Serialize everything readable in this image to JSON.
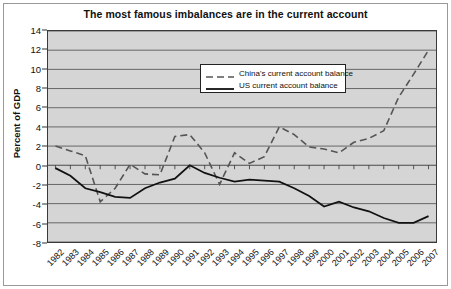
{
  "chart_data": {
    "type": "line",
    "title": "The most famous imbalances are in the current account",
    "xlabel": "",
    "ylabel": "Percent of GDP",
    "ylim": [
      -8,
      14
    ],
    "ytick_step": 2,
    "yticks": [
      "14",
      "12",
      "10",
      "8",
      "6",
      "4",
      "2",
      "0",
      "-2",
      "-4",
      "-6",
      "-8"
    ],
    "grid": true,
    "legend_position": "top-center",
    "plot_background": "#d5d5d5",
    "categories": [
      "1982",
      "1983",
      "1984",
      "1985",
      "1986",
      "1987",
      "1988",
      "1989",
      "1990",
      "1991",
      "1992",
      "1993",
      "1994",
      "1995",
      "1996",
      "1997",
      "1998",
      "1999",
      "2000",
      "2001",
      "2002",
      "2003",
      "2004",
      "2005",
      "2006",
      "2007"
    ],
    "series": [
      {
        "name": "China's current account balance",
        "style": "dashed",
        "color": "#555555",
        "values": [
          2.0,
          1.5,
          1.0,
          -3.8,
          -2.4,
          0.1,
          -0.9,
          -1.0,
          3.0,
          3.2,
          1.3,
          -2.0,
          1.3,
          0.2,
          0.9,
          4.0,
          3.2,
          1.9,
          1.7,
          1.3,
          2.4,
          2.8,
          3.6,
          7.1,
          9.5,
          12.0
        ]
      },
      {
        "name": "US current account balance",
        "style": "solid",
        "color": "#111111",
        "values": [
          -0.3,
          -1.1,
          -2.4,
          -2.8,
          -3.3,
          -3.4,
          -2.4,
          -1.8,
          -1.4,
          0.0,
          -0.8,
          -1.3,
          -1.7,
          -1.5,
          -1.6,
          -1.7,
          -2.4,
          -3.2,
          -4.3,
          -3.8,
          -4.4,
          -4.8,
          -5.5,
          -6.0,
          -6.0,
          -5.3
        ]
      }
    ]
  }
}
